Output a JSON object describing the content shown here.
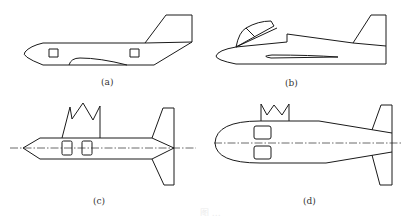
{
  "figure": {
    "panels": [
      {
        "id": "a",
        "label": "(a)",
        "description": "aircraft-like fuselage with swept tail fin, two square windows, and a ventral fairing"
      },
      {
        "id": "b",
        "label": "(b)",
        "description": "aircraft with canopy cockpit, raised rear fuselage, slender wing slot and swept tail fin"
      },
      {
        "id": "c",
        "label": "(c)",
        "description": "symmetric hull with pointed bow and stern, two windows on centerline, zigzag crown sail on top, upper and lower tail fins"
      },
      {
        "id": "d",
        "label": "(d)",
        "description": "rounded blunt-nose hull tapering to stern, two stacked windows, crown-shaped sail on top, upper and lower tail fins"
      }
    ],
    "caption_faint": "图 …"
  },
  "colors": {
    "line": "#1a1a1a",
    "background": "#ffffff"
  }
}
